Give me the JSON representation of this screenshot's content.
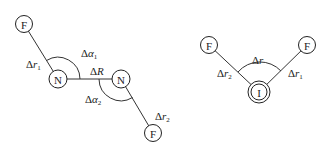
{
  "diagram": {
    "left_molecule": {
      "atoms": {
        "f_top": {
          "label": "F"
        },
        "n_left": {
          "label": "N"
        },
        "n_right": {
          "label": "N"
        },
        "f_bottom": {
          "label": "F"
        }
      },
      "coordinates": {
        "dr1": {
          "delta": "Δ",
          "sym": "r",
          "sub": "1"
        },
        "dalpha1": {
          "delta": "Δ",
          "sym": "α",
          "sub": "1"
        },
        "dR": {
          "delta": "Δ",
          "sym": "R",
          "sub": ""
        },
        "dalpha2": {
          "delta": "Δ",
          "sym": "α",
          "sub": "2"
        },
        "dr2": {
          "delta": "Δ",
          "sym": "r",
          "sub": "2"
        }
      }
    },
    "right_molecule": {
      "atoms": {
        "f_left": {
          "label": "F"
        },
        "i_center": {
          "label": "I"
        },
        "f_right": {
          "label": "F"
        }
      },
      "coordinates": {
        "dr": {
          "delta": "Δ",
          "sym": "r",
          "sub": ""
        },
        "dr2": {
          "delta": "Δ",
          "sym": "r",
          "sub": "2"
        },
        "dr1": {
          "delta": "Δ",
          "sym": "r",
          "sub": "1"
        }
      }
    }
  }
}
